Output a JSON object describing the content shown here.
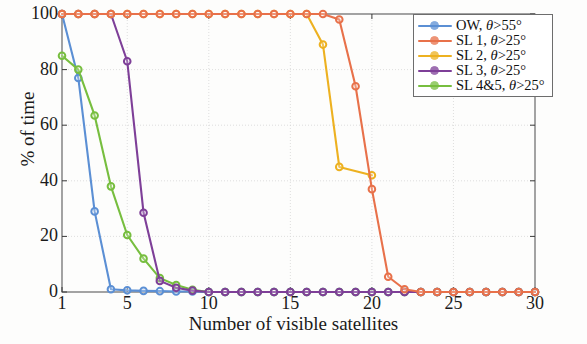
{
  "chart_data": {
    "type": "line",
    "title": "",
    "xlabel": "Number of visible satellites",
    "ylabel": "% of time",
    "xlim": [
      1,
      30
    ],
    "ylim": [
      0,
      100
    ],
    "xticks": [
      1,
      5,
      10,
      15,
      20,
      25,
      30
    ],
    "yticks": [
      0,
      20,
      40,
      60,
      80,
      100
    ],
    "grid": true,
    "legend_position": "upper right",
    "x": [
      1,
      2,
      3,
      4,
      5,
      6,
      7,
      8,
      9,
      10,
      11,
      12,
      13,
      14,
      15,
      16,
      17,
      18,
      19,
      20,
      21,
      22,
      23,
      24,
      25,
      26,
      27,
      28,
      29,
      30
    ],
    "series": [
      {
        "name": "OW, θ>55°",
        "label_prefix": "OW, ",
        "label_symbol": "θ",
        "label_suffix": ">55°",
        "color": "#5b8fd4",
        "values": [
          100,
          77,
          29,
          1,
          0.6,
          0.4,
          0.3,
          0.2,
          0.2,
          0,
          0,
          0,
          0,
          0,
          0,
          0,
          0,
          0,
          0,
          0,
          0,
          0,
          0,
          0,
          0,
          0,
          0,
          0,
          0,
          0
        ]
      },
      {
        "name": "SL 1, θ>25°",
        "label_prefix": "SL 1, ",
        "label_symbol": "θ",
        "label_suffix": ">25°",
        "color": "#e8714a",
        "values": [
          100,
          100,
          100,
          100,
          100,
          100,
          100,
          100,
          100,
          100,
          100,
          100,
          100,
          100,
          100,
          100,
          100,
          98,
          74,
          37,
          5.5,
          1,
          0,
          0,
          0,
          0,
          0,
          0,
          0,
          0
        ]
      },
      {
        "name": "SL 2, θ>25°",
        "label_prefix": "SL 2, ",
        "label_symbol": "θ",
        "label_suffix": ">25°",
        "color": "#edb120",
        "values": [
          100,
          100,
          100,
          100,
          100,
          100,
          100,
          100,
          100,
          100,
          100,
          100,
          100,
          100,
          100,
          100,
          89,
          45,
          null,
          42,
          null,
          null,
          null,
          null,
          null,
          null,
          null,
          null,
          null,
          null
        ]
      },
      {
        "name": "SL 3, θ>25°",
        "label_prefix": "SL 3, ",
        "label_symbol": "θ",
        "label_suffix": ">25°",
        "color": "#7e3f98",
        "values": [
          100,
          100,
          100,
          100,
          83,
          28.5,
          4,
          1.5,
          0.5,
          0,
          0,
          0,
          0,
          0,
          0,
          0,
          0,
          0,
          0,
          0,
          0,
          0,
          0,
          0,
          0,
          0,
          0,
          0,
          0,
          0
        ]
      },
      {
        "name": "SL 4&5, θ>25°",
        "label_prefix": "SL 4&5, ",
        "label_symbol": "θ",
        "label_suffix": ">25°",
        "color": "#77be3f",
        "values": [
          85,
          80,
          63.5,
          38,
          20.5,
          12,
          5,
          2.5,
          0.8,
          0,
          0,
          0,
          0,
          0,
          0,
          0,
          0,
          0,
          0,
          0,
          0,
          0,
          0,
          0,
          0,
          0,
          0,
          0,
          0,
          0
        ]
      }
    ]
  },
  "legend": {
    "entries": [
      {
        "text": "OW, θ>55°",
        "color": "#5b8fd4"
      },
      {
        "text": "SL 1, θ>25°",
        "color": "#e8714a"
      },
      {
        "text": "SL 2, θ>25°",
        "color": "#edb120"
      },
      {
        "text": "SL 3, θ>25°",
        "color": "#7e3f98"
      },
      {
        "text": "SL 4&5, θ>25°",
        "color": "#77be3f"
      }
    ]
  },
  "axes": {
    "xlabel": "Number of visible satellites",
    "ylabel": "% of time",
    "xticklabels": [
      "1",
      "5",
      "10",
      "15",
      "20",
      "25",
      "30"
    ],
    "yticklabels": [
      "0",
      "20",
      "40",
      "60",
      "80",
      "100"
    ]
  }
}
